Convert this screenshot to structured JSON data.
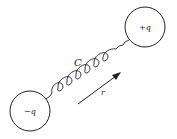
{
  "diagram": {
    "charges": [
      {
        "label": "+q",
        "position": "top-right"
      },
      {
        "label": "−q",
        "position": "bottom-left"
      }
    ],
    "spring_label": "C",
    "vector_label": "r",
    "colors": {
      "stroke": "#222222",
      "background": "#ffffff"
    }
  }
}
